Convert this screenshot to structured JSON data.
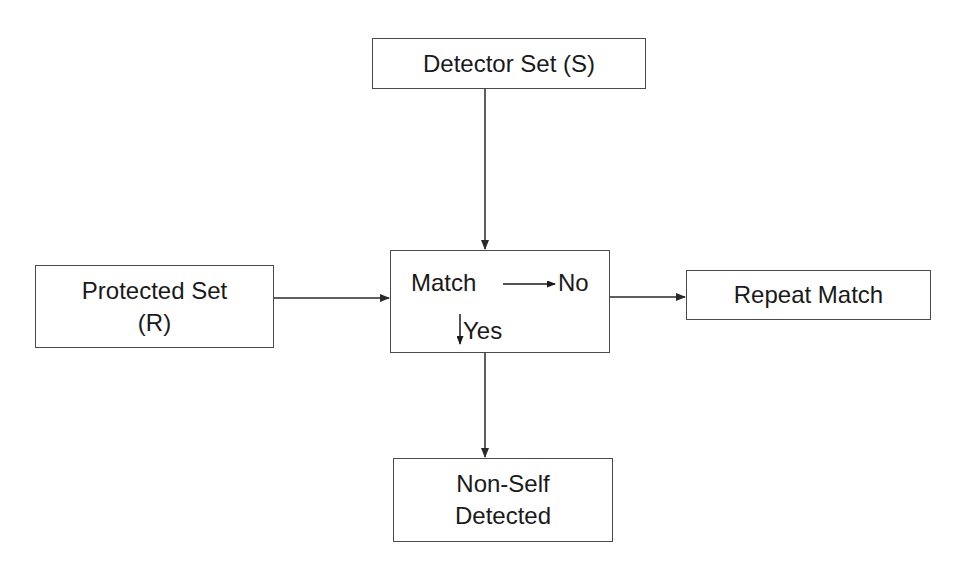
{
  "diagram": {
    "nodes": {
      "detector": {
        "label": "Detector Set (S)"
      },
      "protected": {
        "line1": "Protected Set",
        "line2": "(R)"
      },
      "match": {
        "label": "Match",
        "no_label": "No",
        "yes_label": "Yes"
      },
      "repeat": {
        "label": "Repeat Match"
      },
      "nonself": {
        "line1": "Non-Self",
        "line2": "Detected"
      }
    },
    "edges": [
      {
        "from": "detector",
        "to": "match"
      },
      {
        "from": "protected",
        "to": "match"
      },
      {
        "from": "match",
        "to": "repeat",
        "via": "No"
      },
      {
        "from": "match",
        "to": "nonself",
        "via": "Yes"
      }
    ],
    "colors": {
      "line": "#2a2a2a",
      "border": "#4a4a4a",
      "background": "#ffffff"
    }
  }
}
